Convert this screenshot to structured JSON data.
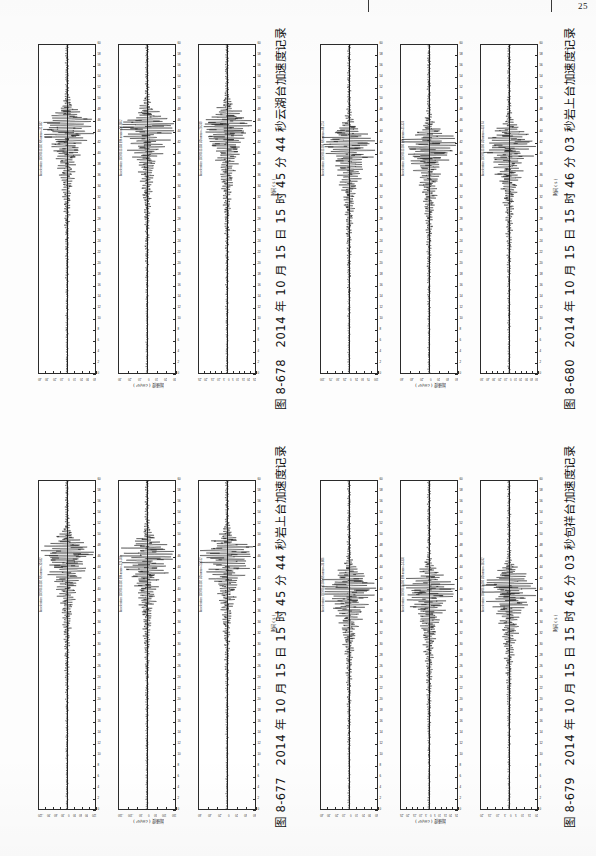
{
  "page": {
    "number": "25",
    "background_hex": "#fdfdfd",
    "ink_hex": "#2b2b2b"
  },
  "axis_titles": {
    "time": "时间 ( s )",
    "amplitude": "加速度 ( cm/s² )"
  },
  "figures": [
    {
      "id": "fig-8-677",
      "caption_number": "图 8-677",
      "caption_text": "2014 年 10 月 15 日 15 时 45 分 44 秒岩上台加速度记录",
      "position": "bottom-left",
      "time_axis": {
        "label": "时间 ( s )",
        "min": 0,
        "max": 60,
        "ticks": [
          0,
          2,
          4,
          6,
          8,
          10,
          12,
          14,
          16,
          18,
          20,
          22,
          24,
          26,
          28,
          30,
          32,
          34,
          36,
          38,
          40,
          42,
          44,
          46,
          48,
          50,
          52,
          54,
          56,
          58,
          60
        ]
      },
      "panels": [
        {
          "channel": "NS",
          "trace_label": "Acceleration 10270615102 NS amax=-101.82",
          "amax": -101.82,
          "amp_ticks": [
            "-120",
            "-90",
            "-60",
            "-30",
            "0",
            "30",
            "60",
            "90",
            "120"
          ],
          "amp_limit": 120,
          "peak_time": 13.5
        },
        {
          "channel": "EW",
          "trace_label": "Acceleration 10270615102 EW amax=-124.366",
          "amax": -124.37,
          "amp_ticks": [
            "-150",
            "-100",
            "-50",
            "0",
            "50",
            "100",
            "150"
          ],
          "amp_limit": 150,
          "peak_time": 13.8
        },
        {
          "channel": "UD",
          "trace_label": "Acceleration 10270615102 UD amax=-53.512",
          "amax": -53.51,
          "amp_ticks": [
            "-60",
            "-40",
            "-20",
            "0",
            "20",
            "40",
            "60"
          ],
          "amp_limit": 60,
          "peak_time": 13.6
        }
      ]
    },
    {
      "id": "fig-8-678",
      "caption_number": "图 8-678",
      "caption_text": "2014 年 10 月 15 日 15 时 45 分 44 秒云湖台加速度记录",
      "position": "top-left",
      "time_axis": {
        "label": "时间 ( s )",
        "min": 0,
        "max": 60,
        "ticks": [
          0,
          2,
          4,
          6,
          8,
          10,
          12,
          14,
          16,
          18,
          20,
          22,
          24,
          26,
          28,
          30,
          32,
          34,
          36,
          38,
          40,
          42,
          44,
          46,
          48,
          50,
          52,
          54,
          56,
          58,
          60
        ]
      },
      "panels": [
        {
          "channel": "NS",
          "trace_label": "Acceleration 10270615102 NS amax=-32.582",
          "amax": -32.58,
          "amp_ticks": [
            "-40",
            "-30",
            "-20",
            "-10",
            "0",
            "10",
            "20",
            "30",
            "40"
          ],
          "amp_limit": 40,
          "peak_time": 15.0
        },
        {
          "channel": "EW",
          "trace_label": "Acceleration 10270615103 EW amax=-28.1862",
          "amax": -28.19,
          "amp_ticks": [
            "-30",
            "-20",
            "-10",
            "0",
            "10",
            "20",
            "30"
          ],
          "amp_limit": 30,
          "peak_time": 15.2
        },
        {
          "channel": "UD",
          "trace_label": "Acceleration 10270615103 UD amax=-20.249",
          "amax": -20.25,
          "amp_ticks": [
            "-25",
            "-20",
            "-15",
            "-10",
            "-5",
            "0",
            "5",
            "10",
            "15",
            "20",
            "25"
          ],
          "amp_limit": 25,
          "peak_time": 15.1
        }
      ]
    },
    {
      "id": "fig-8-679",
      "caption_number": "图 8-679",
      "caption_text": "2014 年 10 月 15 日 15 时 46 分 03 秒包祥台加速度记录",
      "position": "bottom-right",
      "time_axis": {
        "label": "时间 ( s )",
        "min": 0,
        "max": 60,
        "ticks": [
          0,
          2,
          4,
          6,
          8,
          10,
          12,
          14,
          16,
          18,
          20,
          22,
          24,
          26,
          28,
          30,
          32,
          34,
          36,
          38,
          40,
          42,
          44,
          46,
          48,
          50,
          52,
          54,
          56,
          58,
          60
        ]
      },
      "panels": [
        {
          "channel": "NS",
          "trace_label": "Acceleration 10270615160 NS amax=-36.806",
          "amax": -36.81,
          "amp_ticks": [
            "-40",
            "-30",
            "-20",
            "-10",
            "0",
            "10",
            "20",
            "30",
            "40"
          ],
          "amp_limit": 40,
          "peak_time": 19.5
        },
        {
          "channel": "EW",
          "trace_label": "Acceleration 10270615160 EW amax=-24.336",
          "amax": -24.34,
          "amp_ticks": [
            "-25",
            "-20",
            "-15",
            "-10",
            "-5",
            "0",
            "5",
            "10",
            "15",
            "20",
            "25"
          ],
          "amp_limit": 25,
          "peak_time": 19.7
        },
        {
          "channel": "UD",
          "trace_label": "Acceleration 10270615160 UD amax=-18.242",
          "amax": -18.24,
          "amp_ticks": [
            "-20",
            "-15",
            "-10",
            "-5",
            "0",
            "5",
            "10",
            "15",
            "20"
          ],
          "amp_limit": 20,
          "peak_time": 19.6
        }
      ]
    },
    {
      "id": "fig-8-680",
      "caption_number": "图 8-680",
      "caption_text": "2014 年 10 月 15 日 15 时 46 分 03 秒岩上台加速度记录",
      "position": "top-right",
      "time_axis": {
        "label": "时间 ( s )",
        "min": 0,
        "max": 60,
        "ticks": [
          0,
          2,
          4,
          6,
          8,
          10,
          12,
          14,
          16,
          18,
          20,
          22,
          24,
          26,
          28,
          30,
          32,
          34,
          36,
          38,
          40,
          42,
          44,
          46,
          48,
          50,
          52,
          54,
          56,
          58,
          60
        ]
      },
      "panels": [
        {
          "channel": "NS",
          "trace_label": "Acceleration 10270615160 NS amax=-88.224",
          "amax": -88.22,
          "amp_ticks": [
            "-100",
            "-75",
            "-50",
            "-25",
            "0",
            "25",
            "50",
            "75",
            "100"
          ],
          "amp_limit": 100,
          "peak_time": 18.2
        },
        {
          "channel": "EW",
          "trace_label": "Acceleration 10270615160 EW amax=-55.324",
          "amax": -55.32,
          "amp_ticks": [
            "-60",
            "-40",
            "-20",
            "0",
            "20",
            "40",
            "60"
          ],
          "amp_limit": 60,
          "peak_time": 18.4
        },
        {
          "channel": "UD",
          "trace_label": "Acceleration 10270615160 UD amax=-43.174",
          "amax": -43.17,
          "amp_ticks": [
            "-50",
            "-40",
            "-30",
            "-20",
            "-10",
            "0",
            "10",
            "20",
            "30",
            "40",
            "50"
          ],
          "amp_limit": 50,
          "peak_time": 18.3
        }
      ]
    }
  ],
  "chart_data": {
    "type": "line",
    "xlabel": "时间 ( s )",
    "ylabel": "加速度 ( cm/s² )",
    "xlim": [
      0,
      60
    ],
    "grid": false,
    "legend": "none",
    "orientation": "rotated-90",
    "series": [
      {
        "figure": "图 8-677",
        "name": "岩上台 NS",
        "amax": -101.82,
        "ylim": [
          -120,
          120
        ],
        "peak_time_s": 13.5
      },
      {
        "figure": "图 8-677",
        "name": "岩上台 EW",
        "amax": -124.37,
        "ylim": [
          -150,
          150
        ],
        "peak_time_s": 13.8
      },
      {
        "figure": "图 8-677",
        "name": "岩上台 UD",
        "amax": -53.51,
        "ylim": [
          -60,
          60
        ],
        "peak_time_s": 13.6
      },
      {
        "figure": "图 8-678",
        "name": "云湖台 NS",
        "amax": -32.58,
        "ylim": [
          -40,
          40
        ],
        "peak_time_s": 15.0
      },
      {
        "figure": "图 8-678",
        "name": "云湖台 EW",
        "amax": -28.19,
        "ylim": [
          -30,
          30
        ],
        "peak_time_s": 15.2
      },
      {
        "figure": "图 8-678",
        "name": "云湖台 UD",
        "amax": -20.25,
        "ylim": [
          -25,
          25
        ],
        "peak_time_s": 15.1
      },
      {
        "figure": "图 8-679",
        "name": "包祥台 NS",
        "amax": -36.81,
        "ylim": [
          -40,
          40
        ],
        "peak_time_s": 19.5
      },
      {
        "figure": "图 8-679",
        "name": "包祥台 EW",
        "amax": -24.34,
        "ylim": [
          -25,
          25
        ],
        "peak_time_s": 19.7
      },
      {
        "figure": "图 8-679",
        "name": "包祥台 UD",
        "amax": -18.24,
        "ylim": [
          -20,
          20
        ],
        "peak_time_s": 19.6
      },
      {
        "figure": "图 8-680",
        "name": "岩上台 NS",
        "amax": -88.22,
        "ylim": [
          -100,
          100
        ],
        "peak_time_s": 18.2
      },
      {
        "figure": "图 8-680",
        "name": "岩上台 EW",
        "amax": -55.32,
        "ylim": [
          -60,
          60
        ],
        "peak_time_s": 18.4
      },
      {
        "figure": "图 8-680",
        "name": "岩上台 UD",
        "amax": -43.17,
        "ylim": [
          -50,
          50
        ],
        "peak_time_s": 18.3
      }
    ]
  }
}
